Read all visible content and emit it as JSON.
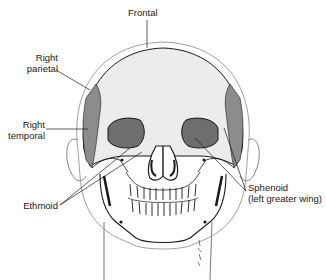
{
  "diagram": {
    "labels": [
      {
        "id": "frontal",
        "text": "Frontal"
      },
      {
        "id": "right-parietal",
        "line1": "Right",
        "line2": "parietal"
      },
      {
        "id": "right-temporal",
        "line1": "Right",
        "line2": "temporal"
      },
      {
        "id": "ethmoid",
        "text": "Ethmoid"
      },
      {
        "id": "sphenoid",
        "line1": "Sphenoid",
        "line2": "(left greater wing)"
      }
    ],
    "colors": {
      "bone_light": "#ececec",
      "bone_shaded": "#8c8c8c",
      "ink": "#1a1a1a",
      "background": "#ffffff"
    }
  }
}
